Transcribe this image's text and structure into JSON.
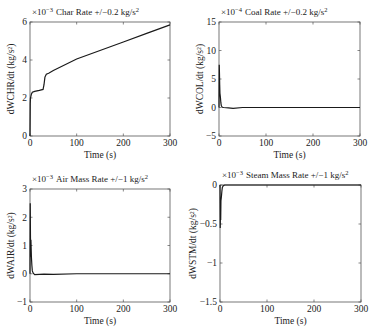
{
  "chart_data": [
    {
      "type": "line",
      "title": "×10^-3 Char Rate +/−0.2 kg/s^2",
      "title_prefix": "×10",
      "title_exp": "−3",
      "title_text": "Char Rate +/−0.2 kg/s",
      "title_sup": "2",
      "xlabel": "Time (s)",
      "ylabel": "dWCHR/dt (kg/s²)",
      "xlim": [
        0,
        300
      ],
      "ylim": [
        0,
        6
      ],
      "scale": "×10^-3",
      "xticks": [
        0,
        100,
        200,
        300
      ],
      "yticks": [
        0,
        2,
        4,
        6
      ],
      "grid": false,
      "series": [
        {
          "name": "dWCHR/dt",
          "x": [
            0,
            0.5,
            1,
            2,
            3,
            5,
            10,
            20,
            28,
            30,
            32,
            35,
            40,
            50,
            100,
            150,
            200,
            250,
            300
          ],
          "y": [
            0,
            1.7,
            2.0,
            2.1,
            2.2,
            2.3,
            2.35,
            2.4,
            2.45,
            2.7,
            3.1,
            3.25,
            3.3,
            3.45,
            4.05,
            4.5,
            4.95,
            5.4,
            5.85
          ]
        }
      ]
    },
    {
      "type": "line",
      "title": "×10^-4 Coal Rate +/−0.2 kg/s^2",
      "title_prefix": "×10",
      "title_exp": "−4",
      "title_text": "Coal Rate +/−0.2 kg/s",
      "title_sup": "2",
      "xlabel": "Time (s)",
      "ylabel": "dWCOL/dt (kg/s²)",
      "xlim": [
        0,
        300
      ],
      "ylim": [
        -5,
        15
      ],
      "scale": "×10^-4",
      "xticks": [
        0,
        100,
        200,
        300
      ],
      "yticks": [
        -5,
        0,
        5,
        10,
        15
      ],
      "grid": false,
      "series": [
        {
          "name": "dWCOL/dt",
          "x": [
            0,
            0.5,
            1,
            1.5,
            2,
            3,
            4,
            5,
            7,
            10,
            20,
            30,
            50,
            100,
            200,
            300
          ],
          "y": [
            0,
            7.5,
            6.0,
            4.0,
            2.5,
            1.8,
            0.8,
            0.3,
            0.05,
            0,
            -0.05,
            -0.15,
            0,
            0,
            0,
            0
          ]
        }
      ]
    },
    {
      "type": "line",
      "title": "×10^-3 Air Mass Rate +/−1 kg/s^2",
      "title_prefix": "×10",
      "title_exp": "−3",
      "title_text": "Air Mass Rate +/−1 kg/s",
      "title_sup": "2",
      "xlabel": "Time (s)",
      "ylabel": "dWAIR/dt (kg/s²)",
      "xlim": [
        0,
        300
      ],
      "ylim": [
        -1,
        3
      ],
      "scale": "×10^-3",
      "xticks": [
        0,
        100,
        200,
        300
      ],
      "yticks": [
        -1,
        0,
        1,
        2,
        3
      ],
      "grid": false,
      "series": [
        {
          "name": "dWAIR/dt",
          "x": [
            0,
            0.5,
            1,
            1.5,
            2,
            3,
            4,
            5,
            7,
            10,
            20,
            30,
            50,
            100,
            200,
            300
          ],
          "y": [
            0,
            2.5,
            1.3,
            0.6,
            1.2,
            0.6,
            0.3,
            0.1,
            0.02,
            -0.03,
            -0.02,
            -0.01,
            -0.02,
            0,
            0,
            0
          ]
        }
      ]
    },
    {
      "type": "line",
      "title": "×10^-3 Steam Mass Rate +/−1 kg/s^2",
      "title_prefix": "×10",
      "title_exp": "−3",
      "title_text": "Steam Mass Rate +/−1 kg/s",
      "title_sup": "2",
      "xlabel": "Time (s)",
      "ylabel": "dWSTM/dt (kg/s²)",
      "xlim": [
        0,
        300
      ],
      "ylim": [
        -1.5,
        0
      ],
      "scale": "×10^-3",
      "xticks": [
        0,
        100,
        200,
        300
      ],
      "yticks": [
        -1.5,
        -1,
        -0.5,
        0
      ],
      "grid": false,
      "series": [
        {
          "name": "dWSTM/dt",
          "x": [
            0,
            0.5,
            1,
            1.5,
            2,
            3,
            4,
            5,
            7,
            10,
            50,
            100,
            200,
            300
          ],
          "y": [
            0,
            -0.55,
            -0.35,
            -0.45,
            -0.2,
            -0.15,
            -0.08,
            -0.03,
            -0.01,
            0,
            0,
            0,
            0,
            0
          ]
        }
      ]
    }
  ],
  "panels": [
    {
      "ytick_labels": [
        "0",
        "2",
        "4",
        "6"
      ],
      "xtick_labels": [
        "0",
        "100",
        "200",
        "300"
      ]
    },
    {
      "ytick_labels": [
        "−5",
        "0",
        "5",
        "10",
        "15"
      ],
      "xtick_labels": [
        "0",
        "100",
        "200",
        "300"
      ]
    },
    {
      "ytick_labels": [
        "−1",
        "0",
        "1",
        "2",
        "3"
      ],
      "xtick_labels": [
        "0",
        "100",
        "200",
        "300"
      ]
    },
    {
      "ytick_labels": [
        "−1.5",
        "−1",
        "−0.5",
        "0"
      ],
      "xtick_labels": [
        "0",
        "100",
        "200",
        "300"
      ]
    }
  ],
  "colors": {
    "axis": "#555555",
    "line": "#1a1a1a"
  }
}
